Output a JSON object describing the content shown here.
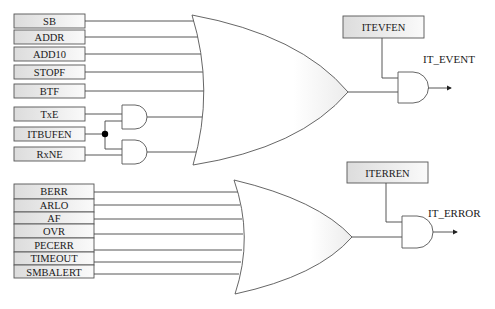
{
  "event_inputs": [
    {
      "label": "SB"
    },
    {
      "label": "ADDR"
    },
    {
      "label": "ADD10"
    },
    {
      "label": "STOPF"
    },
    {
      "label": "BTF"
    },
    {
      "label": "TxE"
    },
    {
      "label": "ITBUFEN"
    },
    {
      "label": "RxNE"
    }
  ],
  "event_enable": {
    "label": "ITEVFEN"
  },
  "event_output": {
    "label": "IT_EVENT"
  },
  "error_inputs": [
    {
      "label": "BERR"
    },
    {
      "label": "ARLO"
    },
    {
      "label": "AF"
    },
    {
      "label": "OVR"
    },
    {
      "label": "PECERR"
    },
    {
      "label": "TIMEOUT"
    },
    {
      "label": "SMBALERT"
    }
  ],
  "error_enable": {
    "label": "ITERREN"
  },
  "error_output": {
    "label": "IT_ERROR"
  },
  "colors": {
    "box_fill_start": "#e2e2e2",
    "box_fill_end": "#fbfbfb",
    "stroke": "#555555",
    "junction": "#000000"
  }
}
